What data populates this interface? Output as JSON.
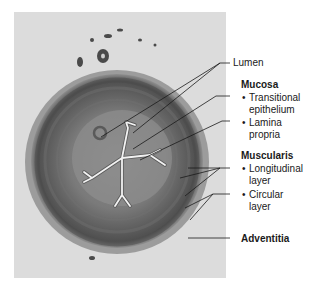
{
  "figure": {
    "panel_color": "#dcdcdc",
    "labels": {
      "lumen": "Lumen",
      "mucosa": "Mucosa",
      "transitional_1": "Transitional",
      "transitional_2": "epithelium",
      "lamina_1": "Lamina",
      "lamina_2": "propria",
      "muscularis": "Muscularis",
      "longitudinal_1": "Longitudinal",
      "longitudinal_2": "layer",
      "circular_1": "Circular",
      "circular_2": "layer",
      "adventitia": "Adventitia"
    }
  }
}
